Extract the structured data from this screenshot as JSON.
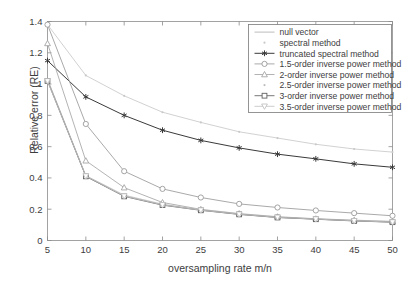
{
  "chart_data": {
    "type": "line",
    "title": "",
    "xlabel": "oversampling rate m/n",
    "ylabel": "Relative error (RE)",
    "xlim": [
      5,
      50
    ],
    "ylim": [
      0,
      1.4
    ],
    "xticks": [
      "5",
      "10",
      "15",
      "20",
      "25",
      "30",
      "35",
      "40",
      "45",
      "50"
    ],
    "yticks": [
      "0",
      "0.2",
      "0.4",
      "0.6",
      "0.8",
      "1",
      "1.2",
      "1.4"
    ],
    "xtick_values": [
      5,
      10,
      15,
      20,
      25,
      30,
      35,
      40,
      45,
      50
    ],
    "ytick_values": [
      0,
      0.2,
      0.4,
      0.6,
      0.8,
      1.0,
      1.2,
      1.4
    ],
    "grid": false,
    "legend_position": "top-right",
    "x": [
      5,
      10,
      15,
      20,
      25,
      30,
      35,
      40,
      45,
      50
    ],
    "series": [
      {
        "name": "null vector",
        "marker": "none",
        "color": "#b0b0b0",
        "values": [
          1.03,
          0.41,
          0.285,
          0.228,
          0.195,
          0.168,
          0.148,
          0.137,
          0.126,
          0.118
        ]
      },
      {
        "name": "spectral method",
        "marker": "dot",
        "color": "#c9c9c9",
        "values": [
          1.38,
          1.055,
          0.925,
          0.82,
          0.755,
          0.695,
          0.655,
          0.615,
          0.585,
          0.565
        ]
      },
      {
        "name": "truncated spectral method",
        "marker": "asterisk",
        "color": "#3a3a3a",
        "values": [
          1.15,
          0.918,
          0.8,
          0.705,
          0.64,
          0.592,
          0.552,
          0.522,
          0.49,
          0.468
        ]
      },
      {
        "name": "1.5-order inverse power method",
        "marker": "circle",
        "color": "#9a9a9a",
        "values": [
          1.38,
          0.745,
          0.443,
          0.33,
          0.275,
          0.234,
          0.211,
          0.192,
          0.175,
          0.158
        ]
      },
      {
        "name": "2-order inverse power method",
        "marker": "triangle-up",
        "color": "#a5a5a5",
        "values": [
          1.26,
          0.51,
          0.338,
          0.243,
          0.199,
          0.172,
          0.152,
          0.139,
          0.13,
          0.122
        ]
      },
      {
        "name": "2.5-order inverse power method",
        "marker": "dot",
        "color": "#bdbdbd",
        "values": [
          1.03,
          0.415,
          0.29,
          0.232,
          0.197,
          0.17,
          0.15,
          0.138,
          0.128,
          0.12
        ]
      },
      {
        "name": "3-order inverse power method",
        "marker": "square",
        "color": "#616161",
        "values": [
          1.02,
          0.41,
          0.282,
          0.226,
          0.193,
          0.167,
          0.147,
          0.136,
          0.125,
          0.117
        ]
      },
      {
        "name": "3.5-order inverse power method",
        "marker": "triangle-down",
        "color": "#c2c2c2",
        "values": [
          1.02,
          0.412,
          0.284,
          0.228,
          0.194,
          0.168,
          0.148,
          0.137,
          0.126,
          0.118
        ]
      }
    ]
  },
  "legend": {
    "items": [
      {
        "label": "null vector"
      },
      {
        "label": "spectral method"
      },
      {
        "label": "truncated spectral method"
      },
      {
        "label": "1.5-order inverse power method"
      },
      {
        "label": "2-order inverse power method"
      },
      {
        "label": "2.5-order inverse power method"
      },
      {
        "label": "3-order inverse power method"
      },
      {
        "label": "3.5-order inverse power method"
      }
    ]
  },
  "axes": {
    "x_label": "oversampling rate m/n",
    "y_label": "Relative error (RE)"
  }
}
